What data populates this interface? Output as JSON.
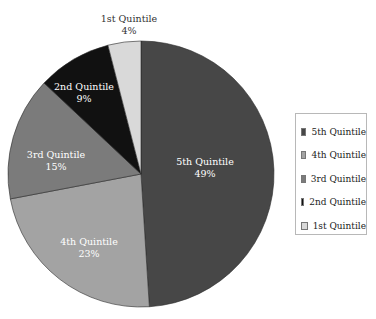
{
  "chart_data": {
    "type": "pie",
    "title": "",
    "categories": [
      "5th Quintile",
      "4th Quintile",
      "3rd Quintile",
      "2nd Quintile",
      "1st Quintile"
    ],
    "values": [
      49,
      23,
      15,
      9,
      4
    ],
    "value_labels": [
      "49%",
      "23%",
      "15%",
      "9%",
      "4%"
    ],
    "colors": [
      "#474747",
      "#a3a3a3",
      "#7b7b7b",
      "#111111",
      "#d9d9d9"
    ],
    "label_colors": [
      "#ffffff",
      "#ffffff",
      "#ffffff",
      "#ffffff",
      "#333333"
    ],
    "start_angle_deg": 0,
    "direction": "clockwise",
    "legend_position": "right",
    "legend": [
      "5th Quintile",
      "4th Quintile",
      "3rd Quintile",
      "2nd Quintile",
      "1st Quintile"
    ]
  },
  "labels": {
    "q5": {
      "name": "5th Quintile",
      "pct": "49%"
    },
    "q4": {
      "name": "4th Quintile",
      "pct": "23%"
    },
    "q3": {
      "name": "3rd Quintile",
      "pct": "15%"
    },
    "q2": {
      "name": "2nd Quintile",
      "pct": "9%"
    },
    "q1": {
      "name": "1st Quintile",
      "pct": "4%"
    }
  },
  "legend": {
    "items": [
      {
        "label": "5th Quintile",
        "color": "#474747"
      },
      {
        "label": "4th Quintile",
        "color": "#a3a3a3"
      },
      {
        "label": "3rd Quintile",
        "color": "#7b7b7b"
      },
      {
        "label": "2nd Quintile",
        "color": "#111111"
      },
      {
        "label": "1st Quintile",
        "color": "#d9d9d9"
      }
    ]
  }
}
